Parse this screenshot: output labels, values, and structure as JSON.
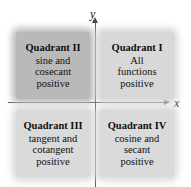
{
  "figure": {
    "axes": {
      "x_label": "x",
      "y_label": "y",
      "x_arrow_icon": "arrow-right-icon",
      "y_arrow_icon": "arrow-up-icon"
    },
    "quadrants": [
      {
        "id": "quadrant-1",
        "title": "Quadrant I",
        "body": "All\nfunctions\npositive",
        "fill": "#d8d8d8"
      },
      {
        "id": "quadrant-2",
        "title": "Quadrant II",
        "body": "sine and\ncosecant\npositive",
        "fill": "#b9b9b9"
      },
      {
        "id": "quadrant-3",
        "title": "Quadrant III",
        "body": "tangent and\ncotangent\npositive",
        "fill": "#dadada"
      },
      {
        "id": "quadrant-4",
        "title": "Quadrant IV",
        "body": "cosine and\nsecant\npositive",
        "fill": "#dadada"
      }
    ],
    "colors": {
      "axis": "#5a5a5a",
      "text": "#101010",
      "background": "#ffffff"
    }
  }
}
